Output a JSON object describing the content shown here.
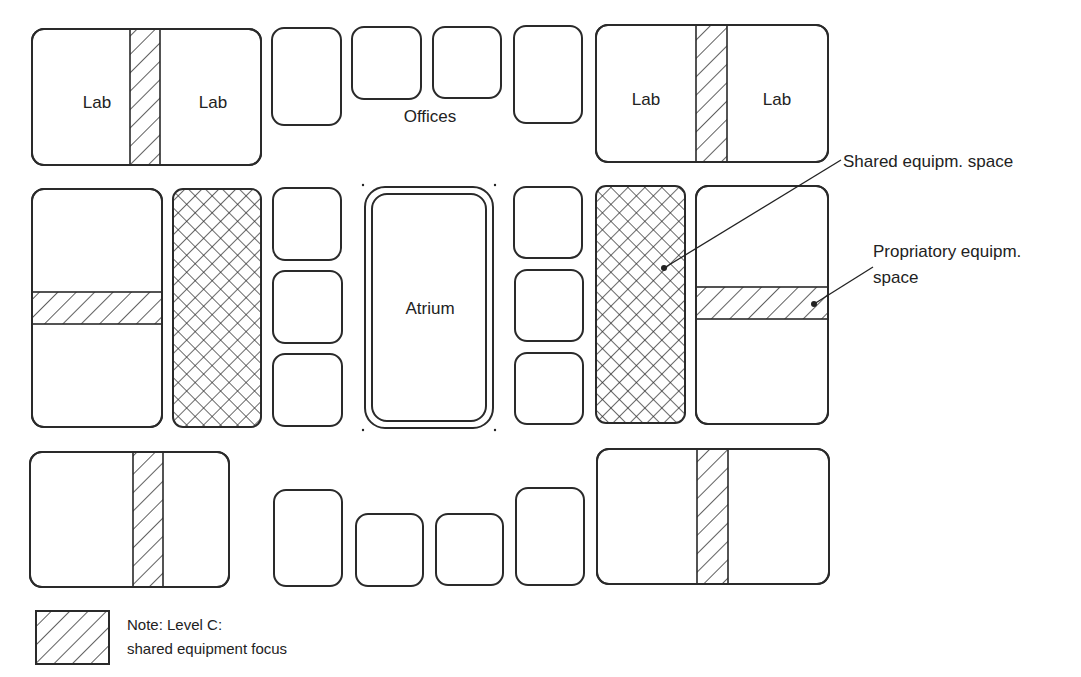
{
  "diagram": {
    "colors": {
      "stroke": "#2a2a2a",
      "background": "#ffffff",
      "text": "#222222"
    },
    "labels": {
      "lab": "Lab",
      "offices": "Offices",
      "atrium": "Atrium",
      "shared_equipment": "Shared equipm. space",
      "proprietary_line1": "Propriatory equipm.",
      "proprietary_line2": "space",
      "legend_line1": "Note: Level C:",
      "legend_line2": "shared equipment focus"
    },
    "lab_blocks": [
      {
        "id": "top-left-lab",
        "x": 32,
        "y": 29,
        "w": 229,
        "h": 136,
        "band": {
          "orient": "v",
          "x": 130,
          "w": 30
        },
        "labels": [
          {
            "text": "Lab",
            "x": 97,
            "y": 108
          },
          {
            "text": "Lab",
            "x": 213,
            "y": 108
          }
        ]
      },
      {
        "id": "top-right-lab",
        "x": 596,
        "y": 25,
        "w": 232,
        "h": 137,
        "band": {
          "orient": "v",
          "x": 696,
          "w": 31
        },
        "labels": [
          {
            "text": "Lab",
            "x": 646,
            "y": 105
          },
          {
            "text": "Lab",
            "x": 777,
            "y": 105
          }
        ]
      },
      {
        "id": "mid-left-lab",
        "x": 32,
        "y": 189,
        "w": 130,
        "h": 238,
        "band": {
          "orient": "h",
          "y": 292,
          "h": 32
        },
        "labels": []
      },
      {
        "id": "mid-right-lab",
        "x": 696,
        "y": 186,
        "w": 132,
        "h": 238,
        "band": {
          "orient": "h",
          "y": 287,
          "h": 32
        },
        "labels": []
      },
      {
        "id": "bottom-left-lab",
        "x": 30,
        "y": 452,
        "w": 199,
        "h": 135,
        "band": {
          "orient": "v",
          "x": 133,
          "w": 30
        },
        "labels": []
      },
      {
        "id": "bottom-right-lab",
        "x": 597,
        "y": 449,
        "w": 232,
        "h": 135,
        "band": {
          "orient": "v",
          "x": 697,
          "w": 31
        },
        "labels": []
      }
    ],
    "offices": [
      {
        "x": 272,
        "y": 28,
        "w": 69,
        "h": 97
      },
      {
        "x": 352,
        "y": 27,
        "w": 69,
        "h": 72
      },
      {
        "x": 433,
        "y": 27,
        "w": 68,
        "h": 71
      },
      {
        "x": 514,
        "y": 26,
        "w": 68,
        "h": 97
      },
      {
        "x": 273,
        "y": 188,
        "w": 68,
        "h": 72
      },
      {
        "x": 273,
        "y": 271,
        "w": 69,
        "h": 72
      },
      {
        "x": 273,
        "y": 354,
        "w": 69,
        "h": 72
      },
      {
        "x": 514,
        "y": 187,
        "w": 68,
        "h": 71
      },
      {
        "x": 515,
        "y": 270,
        "w": 68,
        "h": 71
      },
      {
        "x": 515,
        "y": 353,
        "w": 68,
        "h": 71
      },
      {
        "x": 274,
        "y": 490,
        "w": 68,
        "h": 96
      },
      {
        "x": 356,
        "y": 514,
        "w": 67,
        "h": 72
      },
      {
        "x": 436,
        "y": 514,
        "w": 67,
        "h": 71
      },
      {
        "x": 516,
        "y": 488,
        "w": 68,
        "h": 97
      }
    ],
    "offices_label": {
      "x": 430,
      "y": 122
    },
    "shared_spaces": [
      {
        "id": "shared-left",
        "x": 173,
        "y": 189,
        "w": 88,
        "h": 238
      },
      {
        "id": "shared-right",
        "x": 596,
        "y": 186,
        "w": 89,
        "h": 237
      }
    ],
    "atrium": {
      "x": 365,
      "y": 187,
      "w": 128,
      "h": 241,
      "label_x": 430,
      "label_y": 314
    },
    "callouts": {
      "shared": {
        "text_x": 843,
        "text_y": 167,
        "line": [
          [
            841,
            160
          ],
          [
            664,
            268
          ]
        ]
      },
      "proprietary": {
        "text_x": 873,
        "text_y": 257,
        "text2_y": 283,
        "line": [
          [
            873,
            267
          ],
          [
            814,
            304
          ]
        ]
      }
    },
    "legend": {
      "swatch": {
        "x": 36,
        "y": 611,
        "w": 73,
        "h": 53
      },
      "text_x": 127,
      "line1_y": 630,
      "line2_y": 654
    }
  }
}
